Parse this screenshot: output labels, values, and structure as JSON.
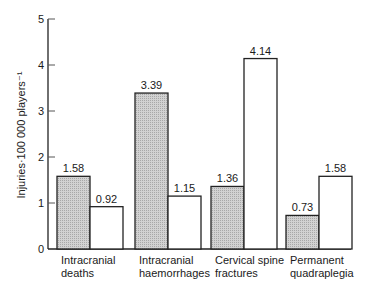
{
  "chart_data": {
    "type": "bar",
    "title": "",
    "xlabel": "",
    "ylabel": "Injuries·100 000 players⁻¹",
    "ylim": [
      0,
      5
    ],
    "yticks": [
      "0",
      "1",
      "2",
      "3",
      "4",
      "5"
    ],
    "grid": false,
    "legend": null,
    "categories": [
      [
        "Intracranial",
        "deaths"
      ],
      [
        "Intracranial",
        "haemorrhages"
      ],
      [
        "Cervical spine",
        "fractures"
      ],
      [
        "Permanent",
        "quadraplegia"
      ]
    ],
    "series": [
      {
        "name": "series-1",
        "style": "shaded",
        "color": "#c8c8c8",
        "values": [
          1.58,
          3.39,
          1.36,
          0.73
        ],
        "labels": [
          "1.58",
          "3.39",
          "1.36",
          "0.73"
        ]
      },
      {
        "name": "series-2",
        "style": "open",
        "color": "#ffffff",
        "values": [
          0.92,
          1.15,
          4.14,
          1.58
        ],
        "labels": [
          "0.92",
          "1.15",
          "4.14",
          "1.58"
        ]
      }
    ]
  }
}
